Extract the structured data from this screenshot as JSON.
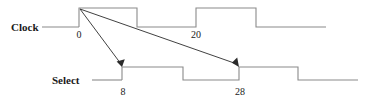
{
  "figure": {
    "type": "timing-diagram",
    "background_color": "#ffffff",
    "wave_color": "#8a8a8a",
    "arrow_color": "#2b2b2b",
    "text_color": "#1a1a1a"
  },
  "signals": [
    {
      "name": "Clock",
      "label": "Clock",
      "label_x": 11,
      "label_y": 31,
      "lead_in": {
        "x1": 42,
        "x2": 79,
        "y": 27
      },
      "high_y": 8,
      "low_y": 27,
      "path": "M 79,27 L 79,8 L 137,8 L 137,27 L 196,27 L 196,8 L 256,8 L 256,27 L 326,27",
      "transitions": [
        {
          "edge": "rise",
          "x": 79,
          "time": 0
        },
        {
          "edge": "fall",
          "x": 137,
          "time": 10
        },
        {
          "edge": "rise",
          "x": 196,
          "time": 20
        },
        {
          "edge": "fall",
          "x": 256,
          "time": 30
        }
      ]
    },
    {
      "name": "Select",
      "label": "Select",
      "label_x": 52,
      "label_y": 84,
      "lead_in": {
        "x1": 92,
        "x2": 122,
        "y": 80
      },
      "high_y": 67,
      "low_y": 80,
      "path": "M 122,80 L 122,67 L 183,67 L 183,80 L 239,80 L 239,67 L 298,67 L 298,80 L 358,80",
      "transitions": [
        {
          "edge": "rise",
          "x": 122,
          "time": 8
        },
        {
          "edge": "fall",
          "x": 183,
          "time": 18
        },
        {
          "edge": "rise",
          "x": 239,
          "time": 28
        },
        {
          "edge": "fall",
          "x": 298,
          "time": 38
        }
      ]
    }
  ],
  "tick_labels": [
    {
      "text": "0",
      "x": 79,
      "y": 38,
      "signal": "Clock"
    },
    {
      "text": "20",
      "x": 196,
      "y": 38,
      "signal": "Clock"
    },
    {
      "text": "8",
      "x": 123,
      "y": 95,
      "signal": "Select"
    },
    {
      "text": "28",
      "x": 240,
      "y": 95,
      "signal": "Select"
    }
  ],
  "annotations": [
    {
      "name": "clock-to-select-rise-8",
      "from_x": 80,
      "from_y": 9,
      "to_x": 122,
      "to_y": 66
    },
    {
      "name": "clock-to-select-rise-28",
      "from_x": 80,
      "from_y": 9,
      "to_x": 239,
      "to_y": 66
    }
  ]
}
